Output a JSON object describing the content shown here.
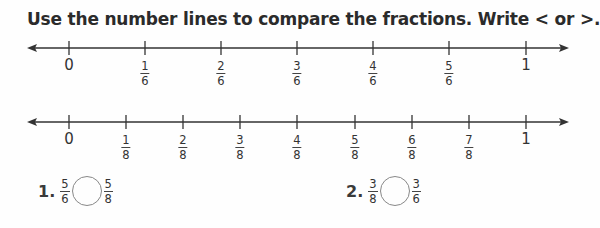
{
  "instruction": "Use the number lines to compare the fractions. Write < or >.",
  "number_lines": [
    {
      "id": "sixths",
      "ticks": [
        {
          "label": "0"
        },
        {
          "num": "1",
          "den": "6"
        },
        {
          "num": "2",
          "den": "6"
        },
        {
          "num": "3",
          "den": "6"
        },
        {
          "num": "4",
          "den": "6"
        },
        {
          "num": "5",
          "den": "6"
        },
        {
          "label": "1"
        }
      ]
    },
    {
      "id": "eighths",
      "ticks": [
        {
          "label": "0"
        },
        {
          "num": "1",
          "den": "8"
        },
        {
          "num": "2",
          "den": "8"
        },
        {
          "num": "3",
          "den": "8"
        },
        {
          "num": "4",
          "den": "8"
        },
        {
          "num": "5",
          "den": "8"
        },
        {
          "num": "6",
          "den": "8"
        },
        {
          "num": "7",
          "den": "8"
        },
        {
          "label": "1"
        }
      ]
    }
  ],
  "problems": [
    {
      "number": "1.",
      "left": {
        "num": "5",
        "den": "6"
      },
      "right": {
        "num": "5",
        "den": "8"
      },
      "answer": ""
    },
    {
      "number": "2.",
      "left": {
        "num": "3",
        "den": "8"
      },
      "right": {
        "num": "3",
        "den": "6"
      },
      "answer": ""
    }
  ]
}
